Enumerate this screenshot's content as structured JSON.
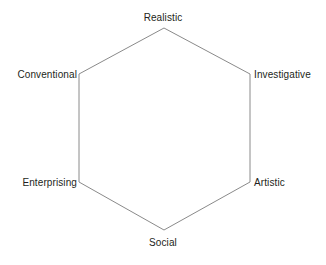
{
  "diagram": {
    "type": "hexagon-model",
    "title": "",
    "stroke_color": "#8a8a8a",
    "fill_color": "#ffffff",
    "background_color": "#ffffff",
    "label_color": "#231f20",
    "vertices": [
      {
        "id": "realistic",
        "label": "Realistic",
        "position": "top",
        "x": 164,
        "y": 28
      },
      {
        "id": "investigative",
        "label": "Investigative",
        "position": "upper-right",
        "x": 250,
        "y": 74
      },
      {
        "id": "artistic",
        "label": "Artistic",
        "position": "lower-right",
        "x": 250,
        "y": 182
      },
      {
        "id": "social",
        "label": "Social",
        "position": "bottom",
        "x": 164,
        "y": 230
      },
      {
        "id": "enterprising",
        "label": "Enterprising",
        "position": "lower-left",
        "x": 79,
        "y": 182
      },
      {
        "id": "conventional",
        "label": "Conventional",
        "position": "upper-left",
        "x": 79,
        "y": 74
      }
    ],
    "labels": {
      "top": "Realistic",
      "upper_right": "Investigative",
      "lower_right": "Artistic",
      "bottom": "Social",
      "lower_left": "Enterprising",
      "upper_left": "Conventional"
    },
    "polygon_points": "164,28 250,74 250,182 164,230 79,182 79,74"
  }
}
